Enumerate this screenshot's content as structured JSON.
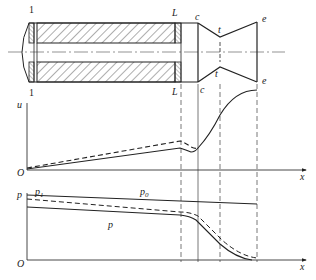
{
  "figure": {
    "section_labels": {
      "head_section": "1",
      "grain_end": "L",
      "chamber_end": "c",
      "throat": "t",
      "exit": "e"
    },
    "velocity_plot": {
      "y_axis_label": "u",
      "x_axis_label": "x",
      "origin_label": "O"
    },
    "pressure_plot": {
      "y_axis_label": "p",
      "x_axis_label": "x",
      "origin_label": "O",
      "curve_labels": {
        "p1_main": "p",
        "p1_sub": "1",
        "p0_main": "p",
        "p0_sub": "0",
        "p": "p"
      }
    },
    "colors": {
      "line": "#222222",
      "axis": "#333333",
      "guide": "#555555",
      "background": "#ffffff"
    }
  }
}
